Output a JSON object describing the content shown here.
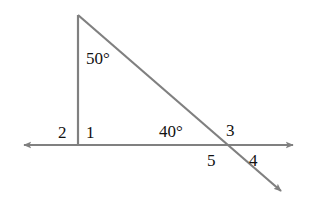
{
  "figure": {
    "background_color": "#ffffff",
    "stroke_color": "#808080",
    "text_color": "#111111",
    "stroke_width": 2.2
  },
  "labels": {
    "apex_angle": "50°",
    "base_angle": "40°",
    "angle_1": "1",
    "angle_2": "2",
    "angle_3": "3",
    "angle_4": "4",
    "angle_5": "5"
  },
  "geometry": {
    "apex": {
      "x": 78,
      "y": 15
    },
    "left_vertex": {
      "x": 78,
      "y": 145
    },
    "intersection": {
      "x": 222,
      "y": 145
    },
    "horizontal_line": {
      "x1": 20,
      "y1": 145,
      "x2": 297,
      "y2": 145
    },
    "vertical_segment": {
      "x1": 78,
      "y1": 15,
      "x2": 78,
      "y2": 145
    },
    "diagonal_ray": {
      "x1": 78,
      "y1": 15,
      "x2": 285,
      "y2": 195
    },
    "arrow_left": {
      "x": 20,
      "y": 145,
      "direction": "west"
    },
    "arrow_right": {
      "x": 297,
      "y": 145,
      "direction": "east"
    },
    "arrow_diagonal": {
      "x": 285,
      "y": 195,
      "direction": "southeast"
    }
  },
  "label_positions": {
    "apex_angle": {
      "left": 86,
      "top": 50
    },
    "base_angle": {
      "left": 159,
      "top": 123
    },
    "angle_1": {
      "left": 86,
      "top": 124
    },
    "angle_2": {
      "left": 58,
      "top": 124
    },
    "angle_3": {
      "left": 226,
      "top": 122
    },
    "angle_4": {
      "left": 249,
      "top": 152
    },
    "angle_5": {
      "left": 207,
      "top": 152
    }
  }
}
